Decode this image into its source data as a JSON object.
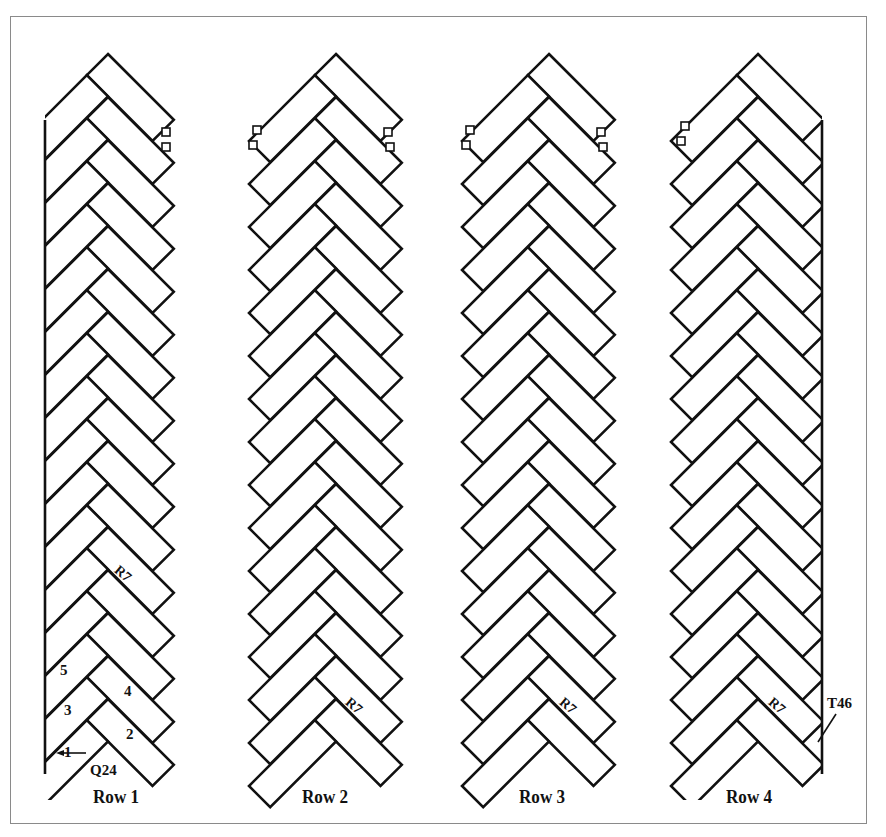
{
  "figure": {
    "type": "herringbone-layout-diagram",
    "rows": [
      {
        "id": "row-1",
        "label": "Row 1",
        "center_x": 108,
        "left_edge": "straight",
        "board_labels": [
          "R7"
        ],
        "sequence_numbers": [
          "1",
          "2",
          "3",
          "4",
          "5"
        ],
        "callouts": [
          "Q24"
        ]
      },
      {
        "id": "row-2",
        "label": "Row 2",
        "center_x": 336,
        "left_edge": "zigzag",
        "board_labels": [
          "R7"
        ]
      },
      {
        "id": "row-3",
        "label": "Row 3",
        "center_x": 549,
        "left_edge": "zigzag",
        "board_labels": [
          "R7"
        ]
      },
      {
        "id": "row-4",
        "label": "Row 4",
        "center_x": 758,
        "right_edge": "straight",
        "board_labels": [
          "R7"
        ],
        "callouts": [
          "T46"
        ]
      }
    ],
    "labels": {
      "row1": "Row 1",
      "row2": "Row 2",
      "row3": "Row 3",
      "row4": "Row 4",
      "board_r7": "R7",
      "callout_q24": "Q24",
      "callout_t46": "T46",
      "seq1": "1",
      "seq2": "2",
      "seq3": "3",
      "seq4": "4",
      "seq5": "5"
    },
    "colors": {
      "line": "#111111",
      "frame": "#8a8a8a",
      "background": "#ffffff"
    }
  }
}
